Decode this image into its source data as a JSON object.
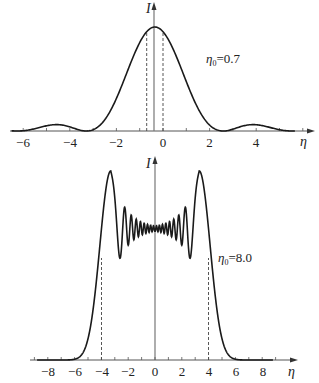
{
  "chart_data": [
    {
      "type": "line",
      "title": "",
      "annotation": "η0=0.7",
      "param_symbol": "η",
      "param_sub": "0",
      "param_value": "=0.7",
      "xlabel": "η",
      "ylabel": "I",
      "xlim": [
        -6.5,
        6.2
      ],
      "x_ticks": [
        -6,
        -4,
        -2,
        0,
        2,
        4
      ],
      "x_tick_labels": [
        "−6",
        "−4",
        "−2",
        "0",
        "2",
        "4"
      ],
      "y_axis_at": -0.35,
      "dashed_lines_x": [
        -0.7,
        0
      ],
      "grid": false,
      "series": [
        {
          "name": "I(η), η0=0.7",
          "x": [
            -6.5,
            -6,
            -5.5,
            -5,
            -4.5,
            -4,
            -3.6,
            -3.3,
            -3,
            -2.5,
            -2,
            -1.5,
            -1,
            -0.7,
            -0.35,
            0,
            0.5,
            1,
            1.5,
            2,
            2.3,
            2.6,
            3,
            3.4,
            3.8,
            4.2,
            4.6,
            5,
            5.5
          ],
          "values": [
            0.0,
            0.01,
            0.03,
            0.05,
            0.06,
            0.05,
            0.02,
            0.0,
            0.03,
            0.17,
            0.4,
            0.66,
            0.88,
            0.96,
            1.0,
            0.96,
            0.83,
            0.62,
            0.37,
            0.14,
            0.05,
            0.0,
            0.02,
            0.05,
            0.06,
            0.05,
            0.03,
            0.01,
            0.0
          ]
        }
      ]
    },
    {
      "type": "line",
      "title": "",
      "annotation": "η0=8.0",
      "param_symbol": "η",
      "param_sub": "0",
      "param_value": "=8.0",
      "xlabel": "η",
      "ylabel": "I",
      "xlim": [
        -9,
        9.5
      ],
      "x_ticks": [
        -8,
        -6,
        -4,
        -2,
        0,
        2,
        4,
        6,
        8
      ],
      "x_tick_labels": [
        "−8",
        "−6",
        "−4",
        "−2",
        "0",
        "2",
        "4",
        "6",
        "8"
      ],
      "y_axis_at": 0,
      "dashed_lines_x": [
        -4,
        4
      ],
      "grid": false,
      "series": [
        {
          "name": "I(η), η0=8.0",
          "x": [
            -8.8,
            -6,
            -5.5,
            -5,
            -4.5,
            -4,
            -3.6,
            -3.3,
            -3.0,
            -2.6,
            -2.2,
            -1.5,
            -0.8,
            0,
            0.8,
            1.5,
            2.2,
            2.6,
            3.0,
            3.3,
            3.6,
            4,
            4.5,
            5,
            5.5,
            6,
            8.8
          ],
          "values": [
            0.0,
            0.01,
            0.04,
            0.14,
            0.38,
            0.63,
            0.85,
            1.0,
            0.62,
            0.83,
            0.64,
            0.77,
            0.72,
            0.73,
            0.72,
            0.77,
            0.64,
            0.83,
            0.62,
            1.0,
            0.85,
            0.63,
            0.38,
            0.14,
            0.04,
            0.01,
            0.0
          ]
        }
      ]
    }
  ],
  "labels": {
    "top": {
      "ylabel": "I",
      "xlabel": "η",
      "param_symbol": "η",
      "param_sub": "0",
      "param_value": "=0.7",
      "ticks": [
        "−6",
        "−4",
        "−2",
        "0",
        "2",
        "4"
      ]
    },
    "bottom": {
      "ylabel": "I",
      "xlabel": "η",
      "param_symbol": "η",
      "param_sub": "0",
      "param_value": "=8.0",
      "ticks": [
        "−8",
        "−6",
        "−4",
        "−2",
        "0",
        "2",
        "4",
        "6",
        "8"
      ]
    }
  },
  "colors": {
    "curve": "#1a1a1a",
    "axis": "#555555",
    "dashed": "#444444"
  }
}
